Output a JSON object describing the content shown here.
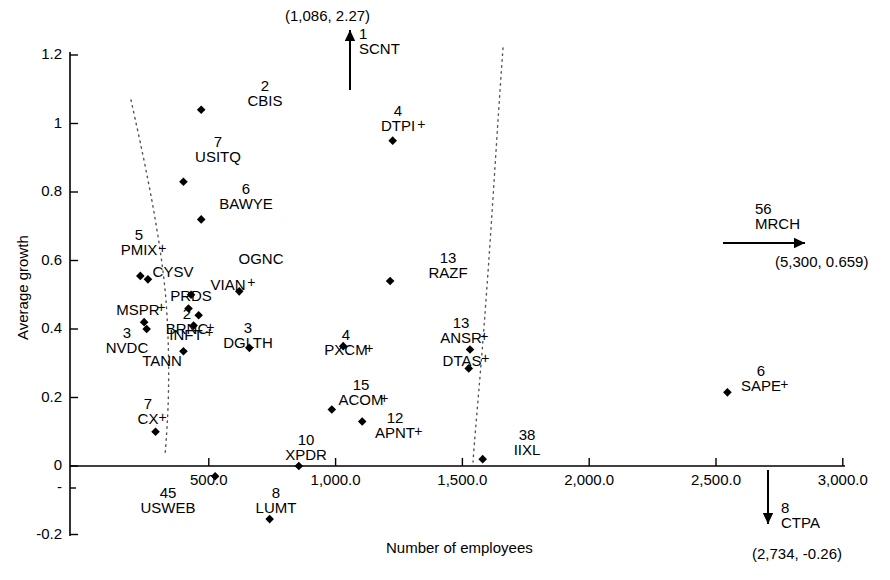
{
  "chart_data": {
    "type": "scatter",
    "title": "",
    "xlabel": "Number of employees",
    "ylabel": "Average growth",
    "xlim": [
      0,
      3000
    ],
    "ylim": [
      -0.2,
      1.2
    ],
    "xticks": [
      "500.0",
      "1,000.0",
      "1,500.0",
      "2,000.0",
      "2,500.0",
      "3,000.0"
    ],
    "xtick_values": [
      500,
      1000,
      1500,
      2000,
      2500,
      3000
    ],
    "yticks": [
      "1.2",
      "1",
      "0.8",
      "0.6",
      "0.4",
      "0.2",
      "0",
      "-0.2"
    ],
    "ytick_values": [
      1.2,
      1.0,
      0.8,
      0.6,
      0.4,
      0.2,
      0.0,
      -0.2
    ],
    "grid": false,
    "legend": "none",
    "marker": "filled-diamond",
    "envelope_curves": 2,
    "points": [
      {
        "ticker": "CBIS",
        "rank": "2",
        "x": 470,
        "y": 1.04,
        "lx": 222,
        "ly": 78,
        "plus": false
      },
      {
        "ticker": "USITQ",
        "rank": "7",
        "x": 400,
        "y": 0.83,
        "lx": 175,
        "ly": 134,
        "plus": false
      },
      {
        "ticker": "BAWYE",
        "rank": "6",
        "x": 470,
        "y": 0.72,
        "lx": 203,
        "ly": 181,
        "plus": false
      },
      {
        "ticker": "PMIX",
        "rank": "5",
        "x": 230,
        "y": 0.555,
        "lx": 96,
        "ly": 227,
        "plus": true
      },
      {
        "ticker": "CYSV",
        "rank": "",
        "x": 260,
        "y": 0.545,
        "lx": 130,
        "ly": 264,
        "plus": false
      },
      {
        "ticker": "OGNC",
        "rank": "",
        "x": 620,
        "y": 0.51,
        "lx": 218,
        "ly": 251,
        "plus": false
      },
      {
        "ticker": "VIAN",
        "rank": "",
        "x": 430,
        "y": 0.5,
        "lx": 185,
        "ly": 277,
        "plus": true
      },
      {
        "ticker": "PRDS",
        "rank": "",
        "x": 420,
        "y": 0.46,
        "lx": 148,
        "ly": 288,
        "plus": false
      },
      {
        "ticker": "MSPR",
        "rank": "",
        "x": 245,
        "y": 0.42,
        "lx": 95,
        "ly": 302,
        "plus": true
      },
      {
        "ticker": "BRNC",
        "rank": "2",
        "x": 460,
        "y": 0.44,
        "lx": 144,
        "ly": 306,
        "plus": true
      },
      {
        "ticker": "INFT",
        "rank": "",
        "x": 440,
        "y": 0.41,
        "lx": 143,
        "ly": 327,
        "plus": true
      },
      {
        "ticker": "DGLTH",
        "rank": "3",
        "x": 660,
        "y": 0.345,
        "lx": 205,
        "ly": 320,
        "plus": false
      },
      {
        "ticker": "NVDC",
        "rank": "3",
        "x": 255,
        "y": 0.4,
        "lx": 84,
        "ly": 325,
        "plus": false
      },
      {
        "ticker": "TANN",
        "rank": "",
        "x": 400,
        "y": 0.335,
        "lx": 119,
        "ly": 353,
        "plus": false
      },
      {
        "ticker": "RAZF",
        "rank": "13",
        "x": 1215,
        "y": 0.54,
        "lx": 405,
        "ly": 250,
        "plus": false
      },
      {
        "ticker": "ANSR",
        "rank": "13",
        "x": 1530,
        "y": 0.34,
        "lx": 418,
        "ly": 315,
        "plus": true
      },
      {
        "ticker": "DTAS",
        "rank": "",
        "x": 1525,
        "y": 0.285,
        "lx": 419,
        "ly": 353,
        "plus": true
      },
      {
        "ticker": "PXCM",
        "rank": "4",
        "x": 1030,
        "y": 0.35,
        "lx": 303,
        "ly": 327,
        "plus": true
      },
      {
        "ticker": "ACOM",
        "rank": "15",
        "x": 985,
        "y": 0.165,
        "lx": 318,
        "ly": 377,
        "plus": true
      },
      {
        "ticker": "APNT",
        "rank": "12",
        "x": 1105,
        "y": 0.13,
        "lx": 352,
        "ly": 410,
        "plus": true
      },
      {
        "ticker": "XPDR",
        "rank": "10",
        "x": 855,
        "y": 0.0,
        "lx": 263,
        "ly": 432,
        "plus": false
      },
      {
        "ticker": "IIXL",
        "rank": "38",
        "x": 1580,
        "y": 0.02,
        "lx": 484,
        "ly": 427,
        "plus": false
      },
      {
        "ticker": "CX",
        "rank": "7",
        "x": 290,
        "y": 0.1,
        "lx": 105,
        "ly": 396,
        "plus": true
      },
      {
        "ticker": "USWEB",
        "rank": "45",
        "x": 525,
        "y": -0.03,
        "lx": 125,
        "ly": 485,
        "plus": false
      },
      {
        "ticker": "LUMT",
        "rank": "8",
        "x": 740,
        "y": -0.155,
        "lx": 233,
        "ly": 485,
        "plus": false
      },
      {
        "ticker": "SAPE",
        "rank": "6",
        "x": 2545,
        "y": 0.215,
        "lx": 718,
        "ly": 363,
        "plus": true
      },
      {
        "ticker": "DTPI",
        "rank": "4",
        "x": 1225,
        "y": 0.95,
        "lx": 355,
        "ly": 103,
        "plus": true
      }
    ],
    "off_scale_annotations": [
      {
        "ticker": "SCNT",
        "rank": "1",
        "coords": "(1,086, 2.27)",
        "direction": "up",
        "coord_x": 285,
        "coord_y": 8,
        "label_x": 359,
        "label_y": 26
      },
      {
        "ticker": "MRCH",
        "rank": "56",
        "coords": "(5,300, 0.659)",
        "direction": "right",
        "coord_x": 775,
        "coord_y": 254,
        "label_x": 755,
        "label_y": 201
      },
      {
        "ticker": "CTPA",
        "rank": "8",
        "coords": "(2,734, -0.26)",
        "direction": "down",
        "coord_x": 752,
        "coord_y": 546,
        "label_x": 781,
        "label_y": 500
      }
    ]
  },
  "axes": {
    "y_title": "Average growth",
    "x_title": "Number of employees"
  }
}
